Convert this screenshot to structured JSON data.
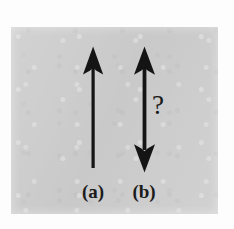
{
  "figure": {
    "background_color": "#cdcdcd",
    "page_color": "#fdfdfd",
    "ink_color": "#141414",
    "annotation": {
      "symbol": "?",
      "name": "question-mark"
    },
    "labels": [
      {
        "id": "a",
        "text": "(a)"
      },
      {
        "id": "b",
        "text": "(b)"
      }
    ],
    "arrows": [
      {
        "id": "a",
        "name": "single-headed-arrow",
        "heads": "up",
        "head_count": 1,
        "x": 93,
        "top_y": 47,
        "bottom_y": 168,
        "shaft_width": 3
      },
      {
        "id": "b",
        "name": "double-headed-arrow",
        "heads": "up-and-down",
        "head_count": 2,
        "x": 144,
        "top_y": 47,
        "bottom_y": 172,
        "shaft_width": 4
      }
    ]
  }
}
